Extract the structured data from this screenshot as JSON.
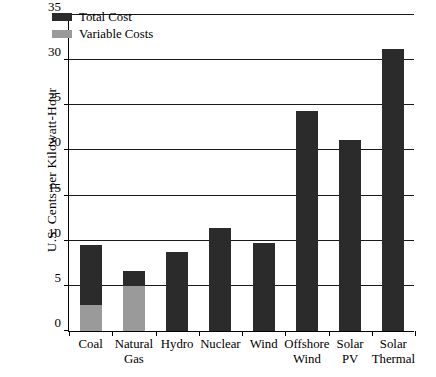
{
  "chart_data": {
    "type": "bar",
    "title": "",
    "xlabel": "",
    "ylabel": "U.S. Cents per Kilowatt-Hour",
    "ylim": [
      0,
      35
    ],
    "yticks": [
      0,
      5,
      10,
      15,
      20,
      25,
      30,
      35
    ],
    "ytick_labels": [
      "0",
      "5",
      "10",
      "15",
      "20",
      "25",
      "30",
      "35"
    ],
    "grid": true,
    "grid_axis": "y",
    "legend_position": "upper left",
    "stacked": true,
    "categories": [
      "Coal",
      "Natural Gas",
      "Hydro",
      "Nuclear",
      "Wind",
      "Offshore Wind",
      "Solar PV",
      "Solar Thermal"
    ],
    "category_lines": [
      [
        "Coal"
      ],
      [
        "Natural",
        "Gas"
      ],
      [
        "Hydro"
      ],
      [
        "Nuclear"
      ],
      [
        "Wind"
      ],
      [
        "Offshore",
        "Wind"
      ],
      [
        "Solar",
        "PV"
      ],
      [
        "Solar",
        "Thermal"
      ]
    ],
    "series": [
      {
        "name": "Total Cost",
        "color": "#2b2b2b",
        "values": [
          9.5,
          6.6,
          8.7,
          11.4,
          9.8,
          24.4,
          21.2,
          31.2
        ]
      },
      {
        "name": "Variable Costs",
        "color": "#9a9a9a",
        "values": [
          2.9,
          5.0,
          0,
          0,
          0,
          0,
          0,
          0
        ]
      }
    ]
  },
  "legend": {
    "items": [
      {
        "label": "Total Cost",
        "swatch": "total"
      },
      {
        "label": "Variable Costs",
        "swatch": "variable"
      }
    ]
  }
}
